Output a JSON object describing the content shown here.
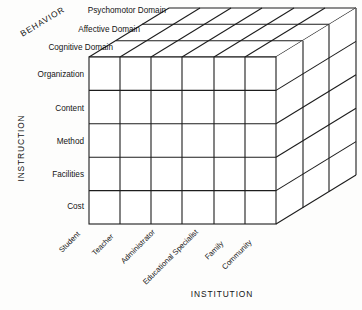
{
  "figure": {
    "type": "three-dimensional-matrix-cube",
    "background_color": "#fdfdfc",
    "line_color": "#1d1d1d",
    "text_color": "#141414"
  },
  "axes": {
    "vertical": {
      "title": "INSTRUCTION",
      "labels": [
        "Organization",
        "Content",
        "Method",
        "Facilities",
        "Cost"
      ]
    },
    "horizontal": {
      "title": "INSTITUTION",
      "labels": [
        "Student",
        "Teacher",
        "Administrator",
        "Educational Specialist",
        "Family",
        "Community"
      ]
    },
    "depth": {
      "title": "BEHAVIOR",
      "labels": [
        "Psychomotor Domain",
        "Affective Domain",
        "Cognitive Domain"
      ]
    }
  },
  "grid": {
    "columns": 6,
    "rows": 5,
    "layers": 3
  }
}
